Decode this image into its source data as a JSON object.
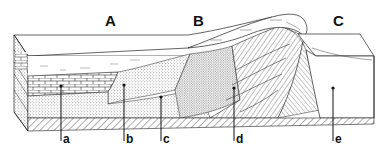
{
  "figure": {
    "zones": [
      {
        "id": "A",
        "label": "A"
      },
      {
        "id": "B",
        "label": "B"
      },
      {
        "id": "C",
        "label": "C"
      }
    ],
    "callouts": [
      {
        "id": "a",
        "label": "a"
      },
      {
        "id": "b",
        "label": "b"
      },
      {
        "id": "c",
        "label": "c"
      },
      {
        "id": "d",
        "label": "d"
      },
      {
        "id": "e",
        "label": "e"
      }
    ],
    "colors": {
      "line": "#222222",
      "stipple": "#555555",
      "background": "#ffffff"
    }
  }
}
